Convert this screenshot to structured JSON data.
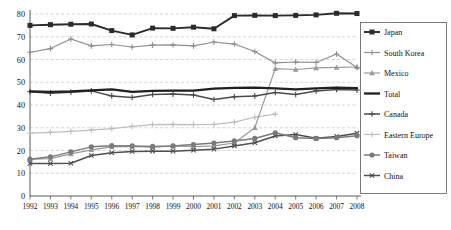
{
  "chart_data": {
    "type": "line",
    "title": "",
    "subtitle": "",
    "xlabel": "",
    "ylabel": "",
    "xlim": [
      1992,
      2008
    ],
    "ylim": [
      0,
      80
    ],
    "yticks": [
      0,
      10,
      20,
      30,
      40,
      50,
      60,
      70,
      80
    ],
    "grid": true,
    "legend_position": "right",
    "categories": [
      "1992",
      "1993",
      "1994",
      "1995",
      "1996",
      "1997",
      "1998",
      "1999",
      "2000",
      "2001",
      "2002",
      "2003",
      "2004",
      "2005",
      "2006",
      "2007",
      "2008"
    ],
    "x": [
      1992,
      1993,
      1994,
      1995,
      1996,
      1997,
      1998,
      1999,
      2000,
      2001,
      2002,
      2003,
      2004,
      2005,
      2006,
      2007,
      2008
    ],
    "series": [
      {
        "name": "Japan",
        "color": "#2b2b2b",
        "marker": "square",
        "width": 1.9,
        "values": [
          75.0,
          75.3,
          75.5,
          75.6,
          72.7,
          70.8,
          73.8,
          73.7,
          74.2,
          73.5,
          79.3,
          79.4,
          79.3,
          79.4,
          79.6,
          80.3,
          80.2
        ]
      },
      {
        "name": "South Korea",
        "color": "#8e8e8e",
        "marker": "plus",
        "width": 1.2,
        "values": [
          63.2,
          64.8,
          69.0,
          66.0,
          66.6,
          65.5,
          66.3,
          66.4,
          66.0,
          67.7,
          66.8,
          63.5,
          58.5,
          58.9,
          58.7,
          62.4,
          56.5
        ]
      },
      {
        "name": "Mexico",
        "color": "#9a9a9a",
        "marker": "triangle",
        "width": 1.2,
        "values": [
          16.2,
          16.4,
          18.5,
          20.3,
          21.6,
          21.8,
          21.5,
          22.0,
          21.7,
          22.0,
          23.3,
          30.0,
          56.0,
          55.6,
          56.3,
          56.5,
          56.7
        ]
      },
      {
        "name": "Total",
        "color": "#1f1f1f",
        "marker": "none",
        "width": 2.3,
        "values": [
          46.0,
          45.8,
          46.0,
          46.4,
          46.9,
          45.8,
          46.2,
          46.3,
          46.3,
          47.2,
          47.5,
          47.6,
          47.3,
          46.9,
          47.3,
          47.6,
          47.4
        ]
      },
      {
        "name": "Canada",
        "color": "#4a4a4a",
        "marker": "plus",
        "width": 1.5,
        "values": [
          45.8,
          45.2,
          45.6,
          46.2,
          44.0,
          43.3,
          44.6,
          44.8,
          44.4,
          42.4,
          43.6,
          44.0,
          45.5,
          44.6,
          46.2,
          46.8,
          46.6
        ]
      },
      {
        "name": "Eastern Europe",
        "color": "#bdbdbd",
        "marker": "plus",
        "width": 1.2,
        "values": [
          27.6,
          28.0,
          28.4,
          29.0,
          29.6,
          30.6,
          31.4,
          31.5,
          31.4,
          31.5,
          32.5,
          34.6,
          36.0,
          null,
          null,
          null,
          null
        ]
      },
      {
        "name": "Taiwan",
        "color": "#7a7a7a",
        "marker": "circle",
        "width": 1.5,
        "values": [
          16.2,
          17.2,
          19.4,
          21.6,
          22.1,
          22.0,
          21.8,
          22.0,
          22.6,
          23.3,
          24.2,
          25.3,
          27.8,
          25.6,
          25.3,
          25.6,
          26.5
        ]
      },
      {
        "name": "China",
        "color": "#4f4f4f",
        "marker": "x",
        "width": 1.5,
        "values": [
          14.3,
          14.3,
          14.4,
          17.8,
          19.0,
          19.6,
          19.7,
          19.7,
          20.1,
          20.6,
          22.0,
          23.4,
          26.4,
          27.0,
          25.4,
          26.2,
          27.6
        ]
      }
    ]
  },
  "legend": {
    "items": [
      {
        "label": "Japan"
      },
      {
        "label": "South Korea"
      },
      {
        "label": "Mexico"
      },
      {
        "label": "Total"
      },
      {
        "label": "Canada"
      },
      {
        "label": "Eastern Europe"
      },
      {
        "label": "Taiwan"
      },
      {
        "label": "China"
      }
    ]
  },
  "axis": {
    "y_labels": [
      "80",
      "70",
      "60",
      "50",
      "40",
      "30",
      "20",
      "10",
      "0"
    ],
    "x_labels": [
      "1992",
      "1993",
      "1994",
      "1995",
      "1996",
      "1997",
      "1998",
      "1999",
      "2000",
      "2001",
      "2002",
      "2003",
      "2004",
      "2005",
      "2006",
      "2007",
      "2008"
    ]
  }
}
